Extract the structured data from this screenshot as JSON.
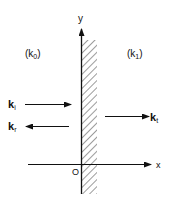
{
  "diagram": {
    "axes": {
      "x_label": "x",
      "y_label": "y",
      "origin_label": "O"
    },
    "regions": {
      "left_label": "(k",
      "left_sub": "0",
      "left_close": ")",
      "right_label": "(k",
      "right_sub": "1",
      "right_close": ")"
    },
    "waves": {
      "incident": {
        "label": "k",
        "sub": "i",
        "direction": "right"
      },
      "reflected": {
        "label": "k",
        "sub": "r",
        "direction": "left"
      },
      "transmitted": {
        "label": "k",
        "sub": "t",
        "direction": "right"
      }
    },
    "colors": {
      "ink": "#111111",
      "background": "#ffffff"
    }
  }
}
